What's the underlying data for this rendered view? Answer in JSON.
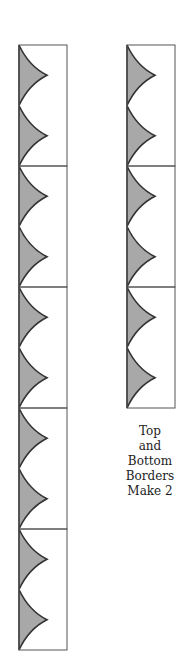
{
  "figure": {
    "type": "quilt-border-diagram",
    "colors": {
      "fill": "#a8a8a8",
      "outline": "#333333",
      "block_border": "#555555",
      "background": "#ffffff"
    },
    "left_strip": {
      "blocks": 5,
      "triangles_per_block": 2
    },
    "right_strip": {
      "blocks": 3,
      "triangles_per_block": 2
    },
    "caption": {
      "lines": [
        "Top",
        "and",
        "Bottom",
        "Borders",
        "Make 2"
      ]
    }
  }
}
